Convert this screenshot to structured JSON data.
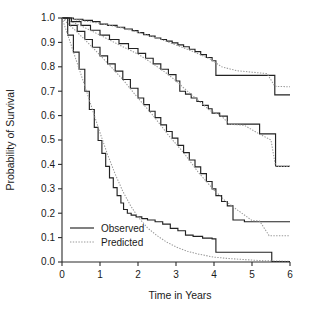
{
  "chart_data": {
    "type": "line",
    "title": "",
    "xlabel": "Time in Years",
    "ylabel": "Probability of Survival",
    "xlim": [
      0,
      6
    ],
    "ylim": [
      0,
      1
    ],
    "grid": false,
    "legend_position": "bottom-left",
    "xticks": [
      "0",
      "1",
      "2",
      "3",
      "4",
      "5",
      "6"
    ],
    "xtick_values": [
      0,
      1,
      2,
      3,
      4,
      5,
      6
    ],
    "yticks": [
      "0.0",
      "0.1",
      "0.2",
      "0.3",
      "0.4",
      "0.5",
      "0.6",
      "0.7",
      "0.8",
      "0.9",
      "1.0"
    ],
    "ytick_values": [
      0.0,
      0.1,
      0.2,
      0.3,
      0.4,
      0.5,
      0.6,
      0.7,
      0.8,
      0.9,
      1.0
    ],
    "legend": [
      {
        "label": "Observed",
        "style": "solid",
        "color": "#222222"
      },
      {
        "label": "Predicted",
        "style": "dotted",
        "color": "#9a9a9a"
      }
    ],
    "series": [
      {
        "name": "Group 1 Observed",
        "style": "solid",
        "color": "#222222",
        "step": "post",
        "x": [
          0.0,
          0.3,
          0.55,
          0.8,
          1.0,
          1.2,
          1.45,
          1.65,
          1.85,
          2.0,
          2.15,
          2.3,
          2.45,
          2.6,
          2.75,
          2.9,
          3.05,
          3.2,
          3.35,
          3.5,
          3.65,
          3.8,
          3.95,
          4.05,
          4.3,
          4.6,
          5.0,
          5.45,
          5.6,
          6.0
        ],
        "y": [
          1.0,
          0.995,
          0.99,
          0.985,
          0.975,
          0.97,
          0.962,
          0.955,
          0.948,
          0.94,
          0.932,
          0.926,
          0.918,
          0.912,
          0.905,
          0.898,
          0.89,
          0.882,
          0.872,
          0.862,
          0.85,
          0.838,
          0.825,
          0.765,
          0.765,
          0.765,
          0.765,
          0.765,
          0.685,
          0.685
        ]
      },
      {
        "name": "Group 1 Predicted",
        "style": "dotted",
        "color": "#9a9a9a",
        "step": "none",
        "x": [
          0.0,
          0.5,
          1.0,
          1.5,
          2.0,
          2.5,
          3.0,
          3.3,
          3.6,
          3.9,
          4.2,
          4.6,
          5.0,
          5.4,
          5.6,
          6.0
        ],
        "y": [
          1.0,
          0.99,
          0.978,
          0.962,
          0.942,
          0.918,
          0.89,
          0.872,
          0.852,
          0.832,
          0.8,
          0.784,
          0.778,
          0.772,
          0.72,
          0.718
        ]
      },
      {
        "name": "Group 2 Observed",
        "style": "solid",
        "color": "#222222",
        "step": "post",
        "x": [
          0.0,
          0.25,
          0.5,
          0.75,
          1.0,
          1.25,
          1.5,
          1.75,
          2.0,
          2.2,
          2.4,
          2.6,
          2.8,
          3.0,
          3.1,
          3.25,
          3.4,
          3.55,
          3.7,
          3.85,
          3.95,
          4.15,
          4.35,
          4.45,
          4.8,
          5.2,
          5.5,
          5.62,
          6.0
        ],
        "y": [
          1.0,
          0.985,
          0.97,
          0.95,
          0.93,
          0.912,
          0.895,
          0.875,
          0.855,
          0.835,
          0.812,
          0.79,
          0.768,
          0.742,
          0.7,
          0.688,
          0.672,
          0.658,
          0.642,
          0.628,
          0.61,
          0.598,
          0.565,
          0.565,
          0.565,
          0.525,
          0.525,
          0.392,
          0.392
        ]
      },
      {
        "name": "Group 2 Predicted",
        "style": "dotted",
        "color": "#9a9a9a",
        "step": "none",
        "x": [
          0.0,
          0.5,
          1.0,
          1.5,
          2.0,
          2.4,
          2.8,
          3.0,
          3.3,
          3.6,
          3.9,
          4.2,
          4.4,
          4.8,
          5.2,
          5.5,
          5.62,
          6.0
        ],
        "y": [
          1.0,
          0.968,
          0.93,
          0.89,
          0.852,
          0.812,
          0.768,
          0.742,
          0.7,
          0.66,
          0.62,
          0.598,
          0.565,
          0.56,
          0.524,
          0.5,
          0.392,
          0.392
        ]
      },
      {
        "name": "Group 3 Observed",
        "style": "solid",
        "color": "#222222",
        "step": "post",
        "x": [
          0.0,
          0.2,
          0.4,
          0.6,
          0.8,
          1.0,
          1.2,
          1.4,
          1.6,
          1.8,
          2.0,
          2.15,
          2.3,
          2.45,
          2.6,
          2.75,
          2.9,
          3.05,
          3.2,
          3.35,
          3.5,
          3.65,
          3.8,
          3.95,
          4.05,
          4.2,
          4.35,
          4.5,
          4.8,
          5.2,
          5.5,
          6.0
        ],
        "y": [
          1.0,
          0.97,
          0.945,
          0.912,
          0.88,
          0.845,
          0.812,
          0.782,
          0.748,
          0.712,
          0.672,
          0.645,
          0.618,
          0.592,
          0.562,
          0.535,
          0.508,
          0.478,
          0.448,
          0.418,
          0.39,
          0.362,
          0.33,
          0.3,
          0.272,
          0.248,
          0.23,
          0.172,
          0.165,
          0.165,
          0.165,
          0.165
        ]
      },
      {
        "name": "Group 3 Predicted",
        "style": "dotted",
        "color": "#9a9a9a",
        "step": "none",
        "x": [
          0.0,
          0.4,
          0.8,
          1.2,
          1.6,
          2.0,
          2.4,
          2.8,
          3.2,
          3.6,
          4.0,
          4.3,
          4.6,
          5.0,
          5.2,
          5.45,
          5.6,
          6.0
        ],
        "y": [
          1.0,
          0.942,
          0.88,
          0.815,
          0.748,
          0.672,
          0.6,
          0.52,
          0.448,
          0.365,
          0.295,
          0.25,
          0.215,
          0.17,
          0.168,
          0.108,
          0.108,
          0.108
        ]
      },
      {
        "name": "Group 4 Observed",
        "style": "solid",
        "color": "#222222",
        "step": "post",
        "x": [
          0.0,
          0.15,
          0.3,
          0.45,
          0.6,
          0.72,
          0.85,
          0.95,
          1.05,
          1.15,
          1.25,
          1.35,
          1.45,
          1.55,
          1.62,
          1.72,
          1.82,
          1.95,
          2.1,
          2.25,
          2.45,
          2.65,
          2.85,
          3.05,
          3.25,
          3.45,
          3.7,
          3.95,
          4.05,
          5.45,
          5.52,
          6.0
        ],
        "y": [
          1.0,
          0.93,
          0.86,
          0.79,
          0.7,
          0.625,
          0.552,
          0.498,
          0.445,
          0.392,
          0.345,
          0.305,
          0.272,
          0.242,
          0.215,
          0.2,
          0.192,
          0.185,
          0.178,
          0.172,
          0.165,
          0.155,
          0.138,
          0.128,
          0.11,
          0.105,
          0.098,
          0.095,
          0.04,
          0.04,
          0.002,
          0.002
        ]
      },
      {
        "name": "Group 4 Predicted",
        "style": "dotted",
        "color": "#9a9a9a",
        "step": "none",
        "x": [
          0.0,
          0.2,
          0.4,
          0.6,
          0.8,
          1.0,
          1.2,
          1.4,
          1.6,
          1.8,
          2.0,
          2.25,
          2.5,
          2.75,
          3.0,
          3.3,
          3.6,
          4.0,
          4.4,
          4.8,
          5.2,
          5.6,
          6.0
        ],
        "y": [
          1.0,
          0.908,
          0.815,
          0.722,
          0.625,
          0.53,
          0.44,
          0.36,
          0.29,
          0.232,
          0.185,
          0.14,
          0.108,
          0.082,
          0.062,
          0.044,
          0.032,
          0.02,
          0.014,
          0.01,
          0.006,
          0.004,
          0.003
        ]
      }
    ]
  }
}
